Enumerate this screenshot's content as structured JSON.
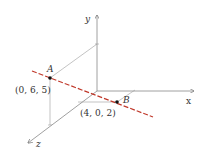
{
  "diagram": {
    "axes": {
      "x_label": "x",
      "y_label": "y",
      "z_label": "z"
    },
    "points": {
      "A": {
        "name": "A",
        "coords": "(0, 6, 5)"
      },
      "B": {
        "name": "B",
        "coords": "(4, 0, 2)"
      }
    },
    "colors": {
      "line": "#c0392b",
      "axis": "#888888",
      "guide": "#9a9a9a",
      "point": "#111111"
    }
  }
}
